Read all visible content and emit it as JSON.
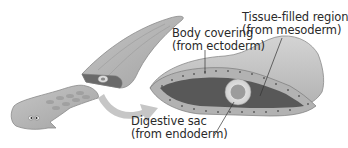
{
  "figure": {
    "colors": {
      "body_light": "#b8b8b8",
      "body_mid": "#a4a4a4",
      "ectoderm_cell": "#b4b4b4",
      "mesoderm": "#5a5a5a",
      "endoderm_ring": "#d8d8d8",
      "gut_center": "#9a9a9a",
      "arrow": "#c4c4c4",
      "text": "#2a2a2a",
      "leader_line": "#333333"
    },
    "labels": {
      "ectoderm": {
        "line1": "Body covering",
        "line2": "(from ectoderm)"
      },
      "mesoderm": {
        "line1": "Tissue-filled region",
        "line2": "(from mesoderm)"
      },
      "endoderm": {
        "line1": "Digestive sac",
        "line2": "(from endoderm)"
      }
    },
    "parts": [
      "whole-flatworm-head-with-eyespots",
      "flatworm-tail-section",
      "cross-section-cut-face",
      "curved-arrow-to-enlargement",
      "enlarged-cross-section"
    ]
  }
}
